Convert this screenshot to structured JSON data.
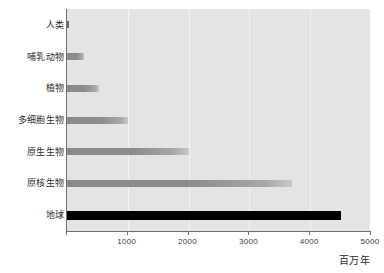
{
  "chart_data": {
    "type": "bar",
    "orientation": "horizontal",
    "title": "",
    "xlabel": "百万年",
    "ylabel": "",
    "xlim": [
      0,
      5000
    ],
    "xticks": [
      0,
      1000,
      2000,
      3000,
      4000,
      5000
    ],
    "xtick_labels": [
      "",
      "1000",
      "2000",
      "3000",
      "4000",
      "5000"
    ],
    "grid": true,
    "grid_axis": "x",
    "legend": false,
    "categories": [
      "人类",
      "哺乳动物",
      "植物",
      "多细胞生物",
      "原生生物",
      "原核生物",
      "地球"
    ],
    "values": [
      2,
      280,
      530,
      1000,
      2000,
      3700,
      4500
    ],
    "bars": [
      {
        "label": "人类",
        "value": 2,
        "color": "#6a6a6a",
        "style": "dark"
      },
      {
        "label": "哺乳动物",
        "value": 280,
        "color": "#8a8a8a",
        "style": "gray"
      },
      {
        "label": "植物",
        "value": 530,
        "color": "#8a8a8a",
        "style": "gray"
      },
      {
        "label": "多细胞生物",
        "value": 1000,
        "color": "#8a8a8a",
        "style": "gray"
      },
      {
        "label": "原生生物",
        "value": 2000,
        "color": "#8a8a8a",
        "style": "gray"
      },
      {
        "label": "原核生物",
        "value": 3700,
        "color": "#8a8a8a",
        "style": "gray"
      },
      {
        "label": "地球",
        "value": 4500,
        "color": "#000000",
        "style": "black"
      }
    ],
    "plot_background": "#e4e4e4",
    "gridline_color": "#f3f3f3",
    "axis_color": "#6f6f6f"
  }
}
